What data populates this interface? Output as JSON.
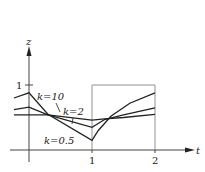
{
  "chart_data": {
    "type": "line",
    "title": "",
    "xlabel": "t",
    "ylabel": "z",
    "xlim": [
      -0.25,
      2.6
    ],
    "ylim": [
      -0.2,
      1.5
    ],
    "x_ticks": [
      "1",
      "2"
    ],
    "y_ticks": [
      "1"
    ],
    "grid": false,
    "legend": "inline labels",
    "reference_box": {
      "t_from": 1,
      "t_to": 2,
      "z_top": 1
    },
    "series": [
      {
        "name": "k=10",
        "label": "k=10",
        "x": [
          -0.24,
          0,
          0.3,
          1.0,
          1.2,
          1.5,
          2.0
        ],
        "y": [
          0.54,
          0.54,
          0.54,
          0.46,
          0.48,
          0.5,
          0.55
        ]
      },
      {
        "name": "k=2",
        "label": "k=2",
        "x": [
          -0.24,
          0,
          0.3,
          1.0,
          1.2,
          1.5,
          2.0
        ],
        "y": [
          0.62,
          0.66,
          0.54,
          0.35,
          0.47,
          0.54,
          0.65
        ]
      },
      {
        "name": "k=0.5",
        "label": "k=0.5",
        "x": [
          -0.24,
          0,
          0.3,
          1.0,
          1.1,
          1.3,
          1.6,
          2.0
        ],
        "y": [
          0.8,
          0.88,
          0.55,
          0.15,
          0.3,
          0.52,
          0.72,
          0.88
        ]
      }
    ]
  },
  "labels": {
    "y_axis": "z",
    "x_axis": "t",
    "y_tick_1": "1",
    "x_tick_1": "1",
    "x_tick_2": "2",
    "k10": "k=10",
    "k2": "k=2",
    "k05": "k=0.5"
  }
}
